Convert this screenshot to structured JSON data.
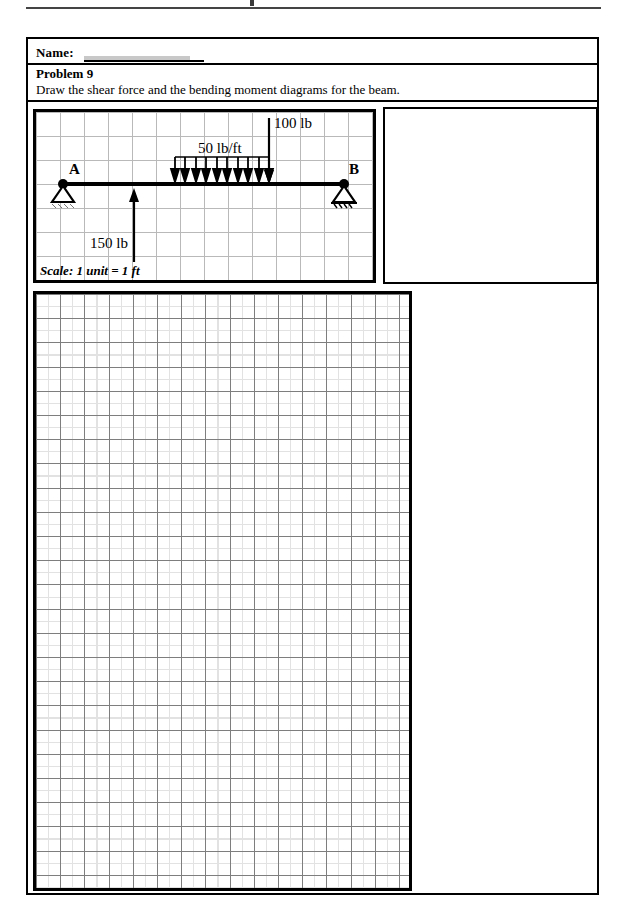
{
  "document": {
    "header_rule": "page-top-rule",
    "name_label": "Name:",
    "name_value": ""
  },
  "problem": {
    "title": "Problem 9",
    "instruction": "Draw the shear force and the bending moment diagrams for the beam."
  },
  "beam_diagram": {
    "scale_note": "Scale: 1 unit = 1 ft",
    "support_left_label": "A",
    "support_right_label": "B",
    "support_left_type": "pin-support",
    "support_right_type": "roller-support",
    "loads": [
      {
        "name": "point-load-up",
        "label": "150 lb",
        "direction": "up",
        "magnitude": 150,
        "unit": "lb",
        "position_ft": 3
      },
      {
        "name": "distributed-load",
        "label": "50 lb/ft",
        "direction": "down",
        "magnitude": 50,
        "unit": "lb/ft",
        "start_ft": 6,
        "end_ft": 9.5,
        "arrow_count": 10
      },
      {
        "name": "point-load-down",
        "label": "100 lb",
        "direction": "down",
        "magnitude": 100,
        "unit": "lb",
        "position_ft": 9.5
      }
    ],
    "grid": {
      "cell_px": 24,
      "columns": 14,
      "rows": 7
    }
  },
  "answer_area": {
    "name": "answer-grid",
    "grid": {
      "minor_cell_px": 12,
      "major_cell_px": 24
    },
    "content": ""
  },
  "side_panel": {
    "name": "blank-side-panel",
    "content": ""
  },
  "colors": {
    "ink": "#000000",
    "grid_minor": "#e2e2e2",
    "grid_major": "#7e7e7e",
    "beam_grid": "#b9b9b9"
  }
}
